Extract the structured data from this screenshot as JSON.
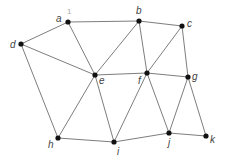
{
  "diagram": {
    "type": "undirected-graph",
    "annotation": {
      "text": "1",
      "x": 67,
      "y": 14
    },
    "nodes": [
      {
        "id": "a",
        "label": "a",
        "x": 68,
        "y": 22,
        "lx": 56,
        "ly": 22
      },
      {
        "id": "b",
        "label": "b",
        "x": 139,
        "y": 21,
        "lx": 136,
        "ly": 14
      },
      {
        "id": "c",
        "label": "c",
        "x": 182,
        "y": 26,
        "lx": 187,
        "ly": 27
      },
      {
        "id": "d",
        "label": "d",
        "x": 21,
        "y": 44,
        "lx": 10,
        "ly": 48
      },
      {
        "id": "e",
        "label": "e",
        "x": 95,
        "y": 75,
        "lx": 99,
        "ly": 84
      },
      {
        "id": "f",
        "label": "f",
        "x": 147,
        "y": 73,
        "lx": 138,
        "ly": 84
      },
      {
        "id": "g",
        "label": "g",
        "x": 188,
        "y": 77,
        "lx": 192,
        "ly": 80
      },
      {
        "id": "h",
        "label": "h",
        "x": 58,
        "y": 138,
        "lx": 48,
        "ly": 148
      },
      {
        "id": "i",
        "label": "i",
        "x": 114,
        "y": 142,
        "lx": 117,
        "ly": 155
      },
      {
        "id": "j",
        "label": "j",
        "x": 169,
        "y": 133,
        "lx": 168,
        "ly": 146
      },
      {
        "id": "k",
        "label": "k",
        "x": 206,
        "y": 136,
        "lx": 210,
        "ly": 143
      }
    ],
    "edges": [
      [
        "a",
        "b"
      ],
      [
        "a",
        "d"
      ],
      [
        "a",
        "e"
      ],
      [
        "b",
        "c"
      ],
      [
        "b",
        "e"
      ],
      [
        "b",
        "f"
      ],
      [
        "c",
        "f"
      ],
      [
        "c",
        "g"
      ],
      [
        "d",
        "e"
      ],
      [
        "d",
        "h"
      ],
      [
        "e",
        "f"
      ],
      [
        "e",
        "h"
      ],
      [
        "e",
        "i"
      ],
      [
        "f",
        "g"
      ],
      [
        "f",
        "i"
      ],
      [
        "f",
        "j"
      ],
      [
        "g",
        "j"
      ],
      [
        "g",
        "k"
      ],
      [
        "h",
        "i"
      ],
      [
        "i",
        "j"
      ],
      [
        "j",
        "k"
      ]
    ],
    "colors": {
      "edge": "#6e6e6e",
      "node": "#111111",
      "label": "#444444",
      "annotation": "#aaaaaa"
    }
  }
}
